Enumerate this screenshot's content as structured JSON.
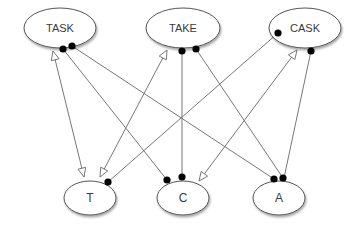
{
  "diagram": {
    "colors": {
      "background": "#ffffff",
      "node_fill": "#ffffff",
      "node_stroke": "#555555",
      "edge": "#777777",
      "dot": "#000000",
      "text": "#3a3a3a"
    },
    "nodes": [
      {
        "id": "TASK",
        "label": "TASK",
        "cx": 60,
        "cy": 28,
        "rx": 36,
        "ry": 20
      },
      {
        "id": "TAKE",
        "label": "TAKE",
        "cx": 183,
        "cy": 28,
        "rx": 37,
        "ry": 20
      },
      {
        "id": "CASK",
        "label": "CASK",
        "cx": 305,
        "cy": 28,
        "rx": 36,
        "ry": 20
      },
      {
        "id": "T",
        "label": "T",
        "cx": 90,
        "cy": 198,
        "rx": 26,
        "ry": 17
      },
      {
        "id": "C",
        "label": "C",
        "cx": 183,
        "cy": 198,
        "rx": 26,
        "ry": 17
      },
      {
        "id": "A",
        "label": "A",
        "cx": 279,
        "cy": 198,
        "rx": 26,
        "ry": 17
      }
    ],
    "edges": [
      {
        "from": "TASK",
        "to": "T",
        "x1": 53,
        "y1": 51,
        "x2": 84,
        "y2": 177,
        "start": "open-arrow",
        "end": "open-arrow"
      },
      {
        "from": "TASK",
        "to": "C",
        "x1": 63,
        "y1": 49,
        "x2": 167,
        "y2": 180,
        "start": "dot",
        "end": "dot"
      },
      {
        "from": "TASK",
        "to": "A",
        "x1": 72,
        "y1": 46,
        "x2": 274,
        "y2": 179,
        "start": "dot",
        "end": "dot"
      },
      {
        "from": "TAKE",
        "to": "T",
        "x1": 167,
        "y1": 50,
        "x2": 100,
        "y2": 177,
        "start": "open-arrow",
        "end": "open-arrow"
      },
      {
        "from": "TAKE",
        "to": "C",
        "x1": 182,
        "y1": 51,
        "x2": 182,
        "y2": 177,
        "start": "dot",
        "end": "dot"
      },
      {
        "from": "TAKE",
        "to": "A",
        "x1": 196,
        "y1": 49,
        "x2": 283,
        "y2": 178,
        "start": "dot",
        "end": "dot"
      },
      {
        "from": "CASK",
        "to": "T",
        "x1": 278,
        "y1": 33,
        "x2": 108,
        "y2": 182,
        "start": "dot",
        "end": "dot"
      },
      {
        "from": "CASK",
        "to": "C",
        "x1": 297,
        "y1": 50,
        "x2": 199,
        "y2": 181,
        "start": "open-arrow",
        "end": "open-arrow"
      },
      {
        "from": "CASK",
        "to": "A",
        "x1": 311,
        "y1": 51,
        "x2": 284,
        "y2": 178,
        "start": "dot",
        "end": "none"
      }
    ]
  }
}
